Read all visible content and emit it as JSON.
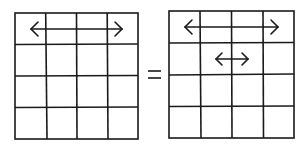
{
  "diagram": {
    "equals_symbol": "=",
    "colors": {
      "stroke": "#1a1a1a",
      "background": "#ffffff"
    },
    "left_grid": {
      "rows": 4,
      "cols": 4,
      "arrows": [
        {
          "type": "double-headed",
          "row": 1,
          "from_col": 1,
          "to_col": 4
        }
      ]
    },
    "right_grid": {
      "rows": 4,
      "cols": 4,
      "arrows": [
        {
          "type": "double-headed",
          "row": 1,
          "from_col": 1,
          "to_col": 4
        },
        {
          "type": "double-headed",
          "row": 2,
          "from_col": 2,
          "to_col": 3
        }
      ]
    }
  }
}
